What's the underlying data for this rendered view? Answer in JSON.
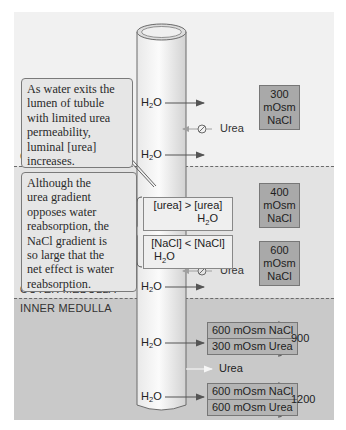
{
  "diagram": {
    "zones": [
      {
        "name": "cortex",
        "label": "CORTEX"
      },
      {
        "name": "outer_medulla",
        "label": "OUTER MEDULLA"
      },
      {
        "name": "inner_medulla",
        "label": "INNER MEDULLA"
      }
    ],
    "callouts": [
      {
        "id": "water_exit",
        "text": "As water exits the\nlumen of tubule\nwith limited urea\npermeability,\nluminal [urea]\nincreases."
      },
      {
        "id": "net_effect",
        "text": "Although the\nurea gradient\nopposes water\nreabsorption, the\nNaCl gradient is\nso large that the\nnet effect is water\nreabsorption."
      }
    ],
    "water_label": "H",
    "water_sub": "2",
    "water_suffix": "O",
    "urea_label": "Urea",
    "interstitium_boxes": [
      {
        "id": "cortex_300",
        "text": "300\nmOsm\nNaCl"
      },
      {
        "id": "outer_400",
        "text": "400\nmOsm\nNaCl"
      },
      {
        "id": "outer_600",
        "text": "600\nmOsm\nNaCl"
      }
    ],
    "gradients": {
      "urea": {
        "left": "[urea] > [urea]",
        "arrow_label": "H",
        "arrow_sub": "2",
        "arrow_suffix": "O"
      },
      "nacl": {
        "left": "[NaCl] < [NaCl]",
        "arrow_label": "H",
        "arrow_sub": "2",
        "arrow_suffix": "O"
      }
    },
    "inner_stacks": [
      {
        "rows": [
          "600 mOsm NaCl",
          "300 mOsm Urea"
        ],
        "total": "900"
      },
      {
        "rows": [
          "600 mOsm NaCl",
          "600 mOsm Urea"
        ],
        "total": "1200"
      }
    ],
    "colors": {
      "cortex_bg": "#f1f1f1",
      "outer_medulla_bg": "#e3e3e3",
      "inner_medulla_bg": "#c9c9c9",
      "osm_box": "#a9a9a9",
      "callout_bg": "#e6e6e6",
      "arrow": "#555555",
      "urea_block_arrow": "#9a9a9a",
      "urea_recycle_arrow": "#f4f4f4"
    }
  }
}
